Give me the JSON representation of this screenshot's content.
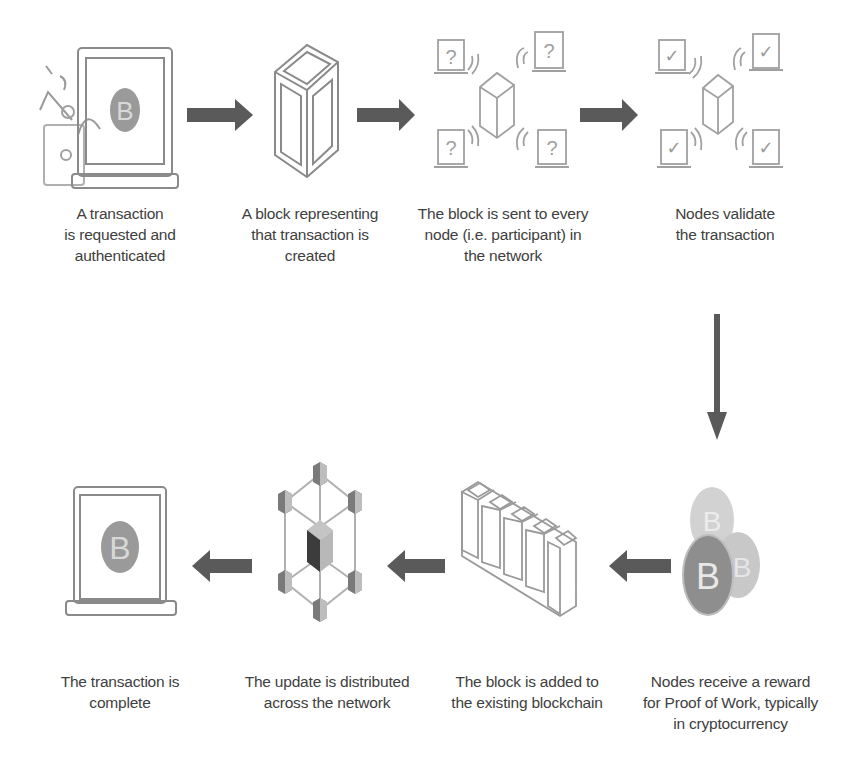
{
  "diagram": {
    "type": "process-flow",
    "colors": {
      "arrow": "#5a5a5a",
      "icon_stroke": "#8a8a8a",
      "coin": "#8c8c8c",
      "text": "#404040",
      "background": "#ffffff"
    },
    "steps": [
      {
        "id": 1,
        "icon": "laptop-bitcoin-payment-icon",
        "lines": [
          "A transaction",
          "is requested and",
          "authenticated"
        ]
      },
      {
        "id": 2,
        "icon": "block-icon",
        "lines": [
          "A block representing",
          "that transaction is",
          "created"
        ]
      },
      {
        "id": 3,
        "icon": "block-broadcast-question-icon",
        "lines": [
          "The block is sent to every",
          "node (i.e. participant) in",
          "the network"
        ]
      },
      {
        "id": 4,
        "icon": "block-broadcast-check-icon",
        "lines": [
          "Nodes validate",
          "the transaction"
        ]
      },
      {
        "id": 5,
        "icon": "bitcoin-coins-icon",
        "lines": [
          "Nodes receive a reward",
          "for Proof of Work, typically",
          "in cryptocurrency"
        ]
      },
      {
        "id": 6,
        "icon": "blockchain-icon",
        "lines": [
          "The block is added to",
          "the existing blockchain"
        ]
      },
      {
        "id": 7,
        "icon": "network-distribution-icon",
        "lines": [
          "The update is distributed",
          "across the network"
        ]
      },
      {
        "id": 8,
        "icon": "laptop-bitcoin-icon",
        "lines": [
          "The transaction is",
          "complete"
        ]
      }
    ],
    "arrows": [
      {
        "from": 1,
        "to": 2,
        "direction": "right"
      },
      {
        "from": 2,
        "to": 3,
        "direction": "right"
      },
      {
        "from": 3,
        "to": 4,
        "direction": "right"
      },
      {
        "from": 4,
        "to": 5,
        "direction": "down"
      },
      {
        "from": 5,
        "to": 6,
        "direction": "left"
      },
      {
        "from": 6,
        "to": 7,
        "direction": "left"
      },
      {
        "from": 7,
        "to": 8,
        "direction": "left"
      }
    ],
    "glyphs": {
      "bitcoin": "B",
      "question": "?",
      "check": "✓"
    }
  }
}
